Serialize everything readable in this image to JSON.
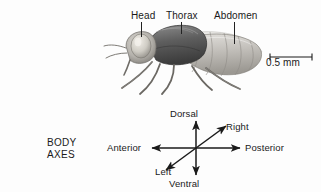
{
  "figure": {
    "organism": "Drosophila melanogaster",
    "background_color": "#fdfdfd",
    "ink_color": "#1a1a1a"
  },
  "body_parts": [
    {
      "label": "Head",
      "leader": true
    },
    {
      "label": "Thorax",
      "leader": true
    },
    {
      "label": "Abdomen",
      "leader": true
    }
  ],
  "scale_bar": {
    "label": "0.5 mm"
  },
  "body_axes": {
    "title_line1": "BODY",
    "title_line2": "AXES",
    "axes": [
      {
        "name": "dorsal",
        "label": "Dorsal",
        "direction": "up"
      },
      {
        "name": "ventral",
        "label": "Ventral",
        "direction": "down"
      },
      {
        "name": "anterior",
        "label": "Anterior",
        "direction": "left"
      },
      {
        "name": "posterior",
        "label": "Posterior",
        "direction": "right"
      },
      {
        "name": "right",
        "label": "Right",
        "direction": "up-right"
      },
      {
        "name": "left",
        "label": "Left",
        "direction": "down-left"
      }
    ]
  }
}
